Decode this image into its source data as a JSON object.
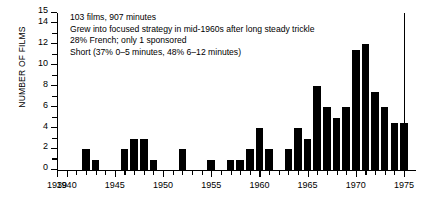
{
  "chart_data": {
    "type": "bar",
    "title": "",
    "subtitle": "",
    "xlabel": "",
    "ylabel": "NUMBER OF FILMS",
    "xlim": [
      1939,
      1975
    ],
    "ylim": [
      0,
      15
    ],
    "grid": false,
    "legend": null,
    "bar_color": "#000000",
    "categories": [
      1939,
      1940,
      1941,
      1942,
      1943,
      1944,
      1945,
      1946,
      1947,
      1948,
      1949,
      1950,
      1951,
      1952,
      1953,
      1954,
      1955,
      1956,
      1957,
      1958,
      1959,
      1960,
      1961,
      1962,
      1963,
      1964,
      1965,
      1966,
      1967,
      1968,
      1969,
      1970,
      1971,
      1972,
      1973,
      1974,
      1975
    ],
    "values": [
      0,
      0,
      0,
      2,
      1,
      0,
      0,
      2,
      3,
      3,
      1,
      0,
      0,
      2,
      0,
      0,
      1,
      0,
      1,
      1,
      2,
      4,
      2,
      0,
      2,
      4,
      3,
      8,
      6,
      5,
      6,
      11.5,
      12,
      7.5,
      6,
      4.5,
      4.5
    ],
    "ytick_values": [
      0,
      1,
      2,
      3,
      4,
      5,
      6,
      7,
      8,
      9,
      10,
      11,
      12,
      13,
      14,
      15
    ],
    "ytick_labels": [
      {
        "value": 0,
        "label": "0"
      },
      {
        "value": 2,
        "label": "2"
      },
      {
        "value": 4,
        "label": "4"
      },
      {
        "value": 6,
        "label": "6"
      },
      {
        "value": 8,
        "label": "8"
      },
      {
        "value": 10,
        "label": "10"
      },
      {
        "value": 12,
        "label": "12"
      },
      {
        "value": 14,
        "label": "14"
      },
      {
        "value": 15,
        "label": "15"
      }
    ],
    "xtick_labels": [
      {
        "value": 1939,
        "label": "1939"
      },
      {
        "value": 1940,
        "label": "1940"
      },
      {
        "value": 1945,
        "label": "1945"
      },
      {
        "value": 1950,
        "label": "1950"
      },
      {
        "value": 1955,
        "label": "1955"
      },
      {
        "value": 1960,
        "label": "1960"
      },
      {
        "value": 1965,
        "label": "1965"
      },
      {
        "value": 1970,
        "label": "1970"
      },
      {
        "value": 1975,
        "label": "1975"
      }
    ],
    "annotations": [
      "103 films, 907 minutes",
      "Grew into focused strategy in mid-1960s after long steady trickle",
      "28% French; only 1 sponsored",
      "Short (37% 0–5 minutes, 48% 6–12 minutes)"
    ]
  }
}
